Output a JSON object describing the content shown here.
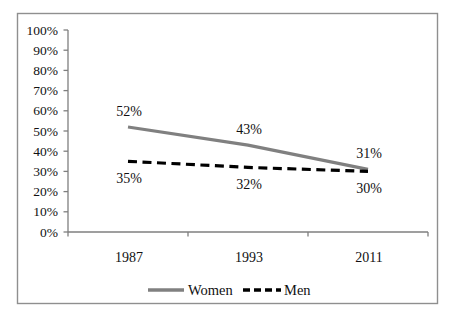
{
  "chart_data": {
    "type": "line",
    "title": "",
    "xlabel": "",
    "ylabel": "",
    "categories": [
      "1987",
      "1993",
      "2011"
    ],
    "series": [
      {
        "name": "Women",
        "values": [
          52,
          43,
          31
        ],
        "point_labels": [
          "52%",
          "43%",
          "31%"
        ],
        "color": "#808080",
        "line_style": "solid",
        "label_position": "above"
      },
      {
        "name": "Men",
        "values": [
          35,
          32,
          30
        ],
        "point_labels": [
          "35%",
          "32%",
          "30%"
        ],
        "color": "#000000",
        "line_style": "dashed",
        "label_position": "below"
      }
    ],
    "y_axis": {
      "min": 0,
      "max": 100,
      "tick_step": 10,
      "tick_labels": [
        "0%",
        "10%",
        "20%",
        "30%",
        "40%",
        "50%",
        "60%",
        "70%",
        "80%",
        "90%",
        "100%"
      ]
    },
    "grid": false,
    "legend_position": "bottom",
    "legend_items": [
      "Women",
      "Men"
    ]
  },
  "colors": {
    "background": "#ffffff",
    "frame_border": "#8f8f8f",
    "axis": "#7f7f7f",
    "text": "#111111",
    "women_line": "#808080",
    "men_line": "#000000"
  }
}
